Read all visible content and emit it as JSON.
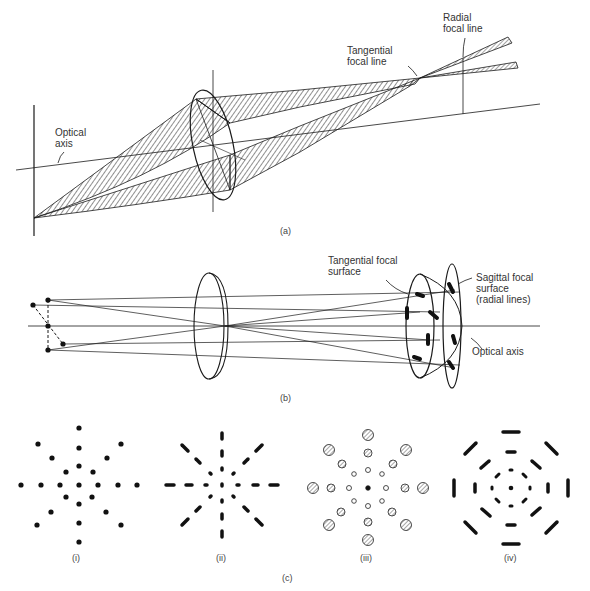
{
  "panel_a": {
    "caption": "(a)",
    "labels": {
      "optical_axis": "Optical\naxis",
      "tangential_focal_line": "Tangential\nfocal line",
      "radial_focal_line": "Radial\nfocal line"
    }
  },
  "panel_b": {
    "caption": "(b)",
    "labels": {
      "tangential_focal_surface": "Tangential focal\nsurface",
      "sagittal_focal_surface": "Sagittal focal\nsurface\n(radial lines)",
      "optical_axis": "Optical axis"
    }
  },
  "panel_c": {
    "caption": "(c)",
    "sub_captions": [
      "(i)",
      "(ii)",
      "(iii)",
      "(iv)"
    ]
  },
  "colors": {
    "ink": "#1a1a1a",
    "background": "#ffffff"
  }
}
